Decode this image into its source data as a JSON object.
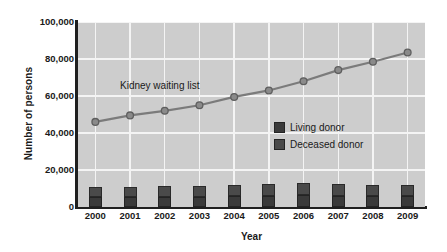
{
  "chart_data": {
    "type": "line",
    "title": "",
    "xlabel": "Year",
    "ylabel": "Number of persons",
    "categories": [
      "2000",
      "2001",
      "2002",
      "2003",
      "2004",
      "2005",
      "2006",
      "2007",
      "2008",
      "2009"
    ],
    "x": [
      2000,
      2001,
      2002,
      2003,
      2004,
      2005,
      2006,
      2007,
      2008,
      2009
    ],
    "ylim": [
      0,
      100000
    ],
    "yticks": [
      0,
      20000,
      40000,
      60000,
      80000,
      100000
    ],
    "ytick_labels": [
      "0",
      "20,000",
      "40,000",
      "60,000",
      "80,000",
      "100,000"
    ],
    "grid": true,
    "legend_position": "center-right",
    "annotations": [
      {
        "text": "Kidney waiting list",
        "x": 2001.2,
        "y": 66000
      }
    ],
    "series": [
      {
        "name": "Kidney waiting list",
        "type": "line",
        "marker": "circle",
        "color": "#7b7b7b",
        "values": [
          46000,
          49500,
          52000,
          55000,
          59500,
          63000,
          68000,
          74000,
          78500,
          83500
        ]
      },
      {
        "name": "Deceased donor",
        "type": "bar",
        "stack": "donors",
        "color": "#4a4a4a",
        "values": [
          5600,
          5700,
          5900,
          6000,
          6200,
          6500,
          6600,
          6100,
          5900,
          6100
        ]
      },
      {
        "name": "Living donor",
        "type": "bar",
        "stack": "donors",
        "color": "#3a3a3a",
        "values": [
          5300,
          5300,
          5500,
          5600,
          5900,
          6100,
          6300,
          6100,
          5800,
          5900
        ]
      }
    ]
  },
  "legend": {
    "items": [
      {
        "label": "Living donor",
        "color": "#3a3a3a"
      },
      {
        "label": "Deceased donor",
        "color": "#4a4a4a"
      }
    ]
  },
  "colors": {
    "plot_background": "#cdcdcd",
    "gridline": "#f4f4f4",
    "axis": "#1f1f1f",
    "line": "#7b7b7b",
    "marker_fill": "#8a8a8a",
    "text": "#1a1a1a"
  }
}
